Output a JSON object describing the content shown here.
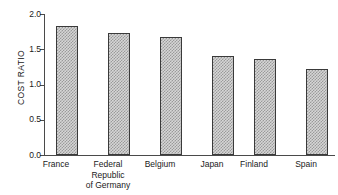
{
  "chart_data": {
    "type": "bar",
    "title": "",
    "subtitle": "",
    "xlabel": "",
    "ylabel": "COST RATIO",
    "categories": [
      "France",
      "Federal\nRepublic\nof Germany",
      "Belgium",
      "Japan",
      "Finland",
      "Spain"
    ],
    "values": [
      1.83,
      1.73,
      1.68,
      1.41,
      1.36,
      1.22
    ],
    "ylim": [
      0.0,
      2.0
    ],
    "ytick_labels": [
      "2.0",
      "1.5",
      "1.0",
      "0.5",
      "0.0"
    ],
    "ytick_values": [
      2.0,
      1.5,
      1.0,
      0.5,
      0.0
    ],
    "grid": false,
    "legend": "none",
    "bar_fill_color": "#d6d6d6",
    "bar_pattern": "checkerboard-dither",
    "bar_edge_color": "#3a3a3a",
    "axis_color": "#4a4a4a",
    "background_color": "#ffffff"
  }
}
